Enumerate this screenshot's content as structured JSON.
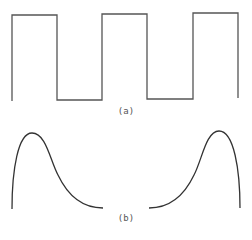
{
  "figure": {
    "panel_a": {
      "label": "(a)",
      "type": "square-wave",
      "stroke": "#555555",
      "path": "M12,101 L12,15 L57,15 L57,100 L102,100 L102,14 L147,14 L147,99 L193,99 L193,13 L238,13 L238,98"
    },
    "panel_b": {
      "label": "(b)",
      "type": "skewed-pulses",
      "stroke": "#333333",
      "left_curve": "M12,209 C12,170 18,133 32,133 C46,133 50,160 58,175 C68,196 82,208 103,208",
      "right_curve": "M149,208 C170,208 184,196 194,175 C202,160 206,131 219,131 C234,131 240,170 240,208"
    }
  }
}
